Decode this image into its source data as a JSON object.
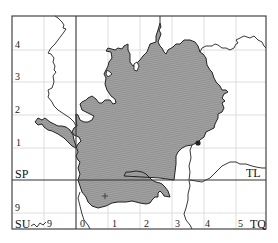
{
  "map": {
    "colors": {
      "region_fill": "#9a9a9a",
      "region_hatch": "#7d7d7d",
      "outline": "#222222",
      "grid_light": "#d4d4d4",
      "grid_heavy": "#333333",
      "frame": "#333333",
      "marker": "#222222"
    },
    "grid_squares": {
      "top_left": "SP",
      "top_right": "TL",
      "bottom_left": "SU",
      "bottom_right": "TQ"
    },
    "left_axis_labels": [
      "4",
      "3",
      "2",
      "1",
      "9"
    ],
    "bottom_axis_labels": [
      "9",
      "0",
      "1",
      "2",
      "3",
      "4",
      "5"
    ],
    "markers": [
      {
        "type": "dot",
        "name": "point-marker"
      },
      {
        "type": "cross",
        "name": "cross-marker"
      }
    ]
  }
}
